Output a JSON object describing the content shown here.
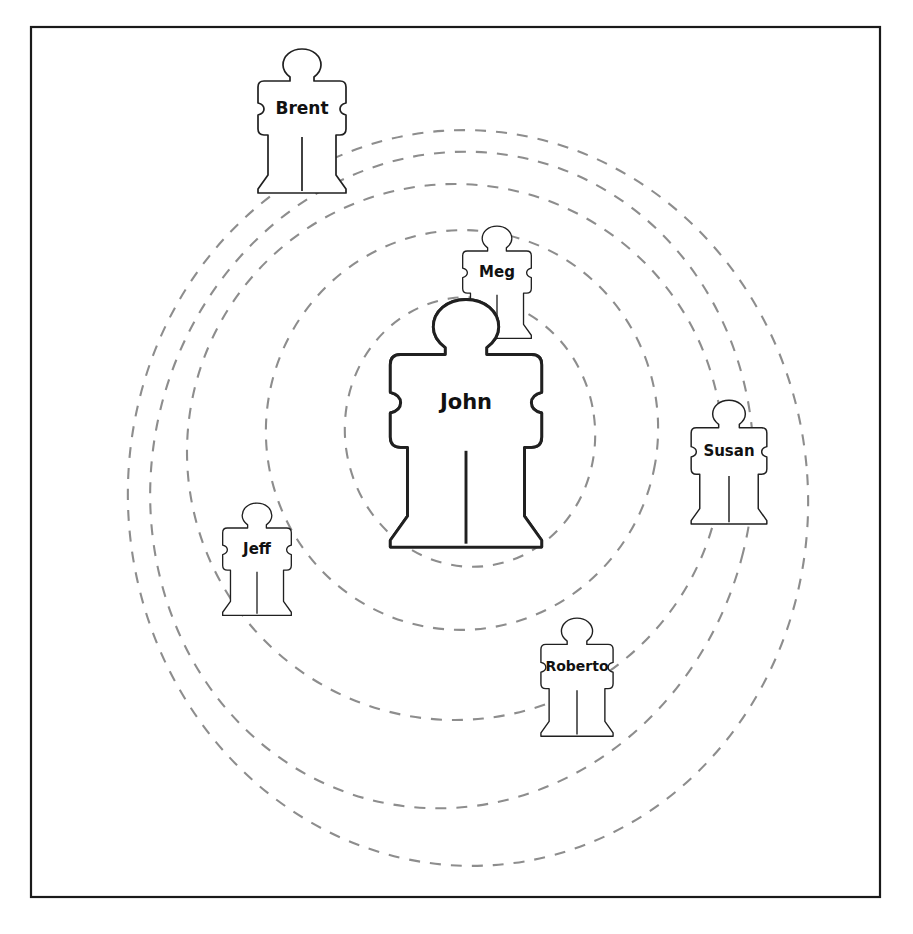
{
  "diagram": {
    "type": "influence-network",
    "center_person": "John",
    "frame": {
      "x": 31,
      "y": 27,
      "width": 849,
      "height": 870,
      "color": "#1a1a1a"
    },
    "ring_color": "#8d8d8d",
    "figure_outline_color": "#202020",
    "figure_fill_color": "#ffffff",
    "center_figure_fill": "speckled-gray-texture",
    "people": [
      {
        "name": "Brent",
        "cx": 302,
        "cy": 122,
        "scale": 1.0,
        "font_size": 17,
        "textured": false
      },
      {
        "name": "Meg",
        "cx": 497,
        "cy": 283,
        "scale": 0.78,
        "font_size": 15,
        "textured": false
      },
      {
        "name": "John",
        "cx": 466,
        "cy": 425,
        "scale": 1.72,
        "font_size": 21,
        "textured": true
      },
      {
        "name": "Susan",
        "cx": 729,
        "cy": 463,
        "scale": 0.86,
        "font_size": 15,
        "textured": false
      },
      {
        "name": "Jeff",
        "cx": 257,
        "cy": 560,
        "scale": 0.78,
        "font_size": 15,
        "textured": false
      },
      {
        "name": "Roberto",
        "cx": 577,
        "cy": 678,
        "scale": 0.82,
        "font_size": 14,
        "textured": false
      }
    ],
    "rings": [
      {
        "label": "ring-1-innermost",
        "cx": 470,
        "cy": 432,
        "rx": 125,
        "ry": 135,
        "rotate": -8
      },
      {
        "label": "ring-2",
        "cx": 462,
        "cy": 430,
        "rx": 196,
        "ry": 200,
        "rotate": 10
      },
      {
        "label": "ring-3",
        "cx": 455,
        "cy": 452,
        "rx": 268,
        "ry": 268,
        "rotate": -6
      },
      {
        "label": "ring-4",
        "cx": 452,
        "cy": 480,
        "rx": 300,
        "ry": 330,
        "rotate": 14
      },
      {
        "label": "ring-5-outermost",
        "cx": 468,
        "cy": 498,
        "rx": 340,
        "ry": 368,
        "rotate": -4
      }
    ]
  }
}
